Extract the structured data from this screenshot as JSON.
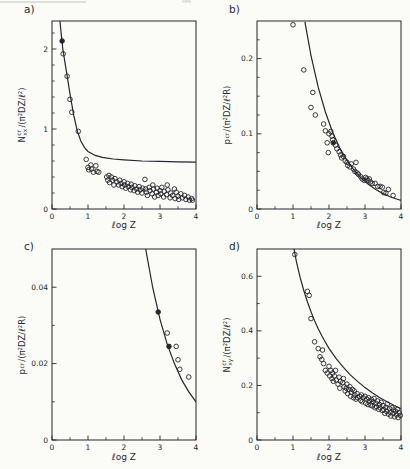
{
  "figure": {
    "background": "#fbfbf8",
    "ink": "#26262b",
    "marker": "open-circle"
  },
  "chart_data": [
    {
      "type": "scatter",
      "panel_label": "a)",
      "xlabel": "ℓog Z",
      "ylabel": {
        "pre": "N",
        "sup": "cr",
        "sub": "xx",
        "post": "/(π²DZ/ℓ²)"
      },
      "xlim": [
        0,
        4
      ],
      "ylim": [
        0,
        2.35
      ],
      "x_ticks": [
        {
          "v": 0,
          "label": "0"
        },
        {
          "v": 1,
          "label": "1"
        },
        {
          "v": 2,
          "label": "2"
        },
        {
          "v": 3,
          "label": "3"
        },
        {
          "v": 4,
          "label": "4"
        }
      ],
      "x_minor_step": 0.5,
      "y_ticks": [
        {
          "v": 0,
          "label": "0"
        },
        {
          "v": 1,
          "label": "1"
        },
        {
          "v": 2,
          "label": "2"
        }
      ],
      "y_minor_step": 0.2,
      "curve": [
        [
          0.22,
          2.35
        ],
        [
          0.3,
          2.0
        ],
        [
          0.4,
          1.72
        ],
        [
          0.5,
          1.44
        ],
        [
          0.6,
          1.18
        ],
        [
          0.7,
          0.98
        ],
        [
          0.8,
          0.85
        ],
        [
          0.9,
          0.77
        ],
        [
          1.0,
          0.72
        ],
        [
          1.2,
          0.67
        ],
        [
          1.4,
          0.645
        ],
        [
          1.7,
          0.625
        ],
        [
          2.0,
          0.615
        ],
        [
          2.5,
          0.6
        ],
        [
          3.0,
          0.595
        ],
        [
          3.5,
          0.59
        ],
        [
          4.0,
          0.585
        ]
      ],
      "points": [
        [
          0.28,
          2.1,
          1
        ],
        [
          0.31,
          1.94
        ],
        [
          0.42,
          1.66
        ],
        [
          0.5,
          1.37
        ],
        [
          0.55,
          1.21
        ],
        [
          0.73,
          0.97
        ],
        [
          0.95,
          0.62
        ],
        [
          1.0,
          0.52
        ],
        [
          1.02,
          0.49
        ],
        [
          1.08,
          0.55
        ],
        [
          1.1,
          0.5
        ],
        [
          1.15,
          0.46
        ],
        [
          1.22,
          0.54
        ],
        [
          1.25,
          0.47
        ],
        [
          1.3,
          0.46
        ],
        [
          1.52,
          0.4
        ],
        [
          1.55,
          0.36
        ],
        [
          1.58,
          0.42
        ],
        [
          1.6,
          0.33
        ],
        [
          1.65,
          0.4
        ],
        [
          1.68,
          0.36
        ],
        [
          1.72,
          0.3
        ],
        [
          1.75,
          0.38
        ],
        [
          1.8,
          0.34
        ],
        [
          1.85,
          0.3
        ],
        [
          1.88,
          0.36
        ],
        [
          1.92,
          0.32
        ],
        [
          1.95,
          0.28
        ],
        [
          2.0,
          0.34
        ],
        [
          2.02,
          0.3
        ],
        [
          2.05,
          0.26
        ],
        [
          2.1,
          0.32
        ],
        [
          2.12,
          0.28
        ],
        [
          2.18,
          0.24
        ],
        [
          2.2,
          0.31
        ],
        [
          2.22,
          0.27
        ],
        [
          2.28,
          0.23
        ],
        [
          2.3,
          0.29
        ],
        [
          2.35,
          0.25
        ],
        [
          2.38,
          0.21
        ],
        [
          2.42,
          0.28
        ],
        [
          2.45,
          0.24
        ],
        [
          2.5,
          0.2
        ],
        [
          2.52,
          0.26
        ],
        [
          2.58,
          0.37
        ],
        [
          2.6,
          0.25
        ],
        [
          2.62,
          0.21
        ],
        [
          2.65,
          0.17
        ],
        [
          2.7,
          0.27
        ],
        [
          2.72,
          0.23
        ],
        [
          2.78,
          0.19
        ],
        [
          2.8,
          0.3
        ],
        [
          2.82,
          0.25
        ],
        [
          2.85,
          0.15
        ],
        [
          2.9,
          0.21
        ],
        [
          2.92,
          0.26
        ],
        [
          2.95,
          0.17
        ],
        [
          3.0,
          0.23
        ],
        [
          3.02,
          0.19
        ],
        [
          3.05,
          0.27
        ],
        [
          3.1,
          0.15
        ],
        [
          3.12,
          0.22
        ],
        [
          3.18,
          0.18
        ],
        [
          3.2,
          0.3
        ],
        [
          3.22,
          0.24
        ],
        [
          3.28,
          0.14
        ],
        [
          3.3,
          0.2
        ],
        [
          3.35,
          0.17
        ],
        [
          3.4,
          0.25
        ],
        [
          3.42,
          0.13
        ],
        [
          3.45,
          0.21
        ],
        [
          3.5,
          0.16
        ],
        [
          3.52,
          0.12
        ],
        [
          3.58,
          0.19
        ],
        [
          3.62,
          0.14
        ],
        [
          3.68,
          0.17
        ],
        [
          3.72,
          0.12
        ],
        [
          3.78,
          0.15
        ],
        [
          3.82,
          0.11
        ],
        [
          3.88,
          0.13
        ],
        [
          3.9,
          0.11
        ]
      ]
    },
    {
      "type": "scatter",
      "panel_label": "b)",
      "xlabel": "ℓog Z",
      "ylabel": {
        "pre": "p",
        "sup": "",
        "sub": "cr",
        "post": "/(π²DZ/ℓ²R)"
      },
      "xlim": [
        0,
        4
      ],
      "ylim": [
        0,
        0.25
      ],
      "x_ticks": [
        {
          "v": 0,
          "label": "0"
        },
        {
          "v": 1,
          "label": "1"
        },
        {
          "v": 2,
          "label": "2"
        },
        {
          "v": 3,
          "label": "3"
        },
        {
          "v": 4,
          "label": "4"
        }
      ],
      "x_minor_step": 0.5,
      "y_ticks": [
        {
          "v": 0,
          "label": "0"
        },
        {
          "v": 0.1,
          "label": "0.1"
        },
        {
          "v": 0.2,
          "label": "0.2"
        }
      ],
      "y_minor_step": 0.025,
      "curve": [
        [
          1.33,
          0.249
        ],
        [
          1.5,
          0.204
        ],
        [
          1.7,
          0.162
        ],
        [
          1.9,
          0.129
        ],
        [
          2.1,
          0.102
        ],
        [
          2.3,
          0.081
        ],
        [
          2.5,
          0.0647
        ],
        [
          2.7,
          0.0514
        ],
        [
          2.9,
          0.0408
        ],
        [
          3.1,
          0.0324
        ],
        [
          3.3,
          0.0258
        ],
        [
          3.5,
          0.0205
        ],
        [
          3.7,
          0.0163
        ],
        [
          3.9,
          0.0129
        ],
        [
          4.0,
          0.0115
        ]
      ],
      "points": [
        [
          1.0,
          0.245
        ],
        [
          1.3,
          0.185
        ],
        [
          1.5,
          0.135
        ],
        [
          1.55,
          0.155
        ],
        [
          1.62,
          0.125
        ],
        [
          1.85,
          0.113
        ],
        [
          1.9,
          0.104
        ],
        [
          1.95,
          0.088
        ],
        [
          1.98,
          0.075
        ],
        [
          2.0,
          0.1
        ],
        [
          2.05,
          0.103
        ],
        [
          2.08,
          0.097
        ],
        [
          2.1,
          0.092
        ],
        [
          2.12,
          0.088,
          1
        ],
        [
          2.18,
          0.085
        ],
        [
          2.22,
          0.08
        ],
        [
          2.28,
          0.076
        ],
        [
          2.32,
          0.072
        ],
        [
          2.35,
          0.068
        ],
        [
          2.4,
          0.07
        ],
        [
          2.45,
          0.064
        ],
        [
          2.5,
          0.062
        ],
        [
          2.52,
          0.058
        ],
        [
          2.58,
          0.056
        ],
        [
          2.62,
          0.06
        ],
        [
          2.68,
          0.053
        ],
        [
          2.72,
          0.05
        ],
        [
          2.75,
          0.062
        ],
        [
          2.78,
          0.048
        ],
        [
          2.82,
          0.046
        ],
        [
          2.88,
          0.043
        ],
        [
          2.92,
          0.04
        ],
        [
          2.98,
          0.038
        ],
        [
          3.02,
          0.042
        ],
        [
          3.05,
          0.04
        ],
        [
          3.08,
          0.038
        ],
        [
          3.12,
          0.04
        ],
        [
          3.15,
          0.036
        ],
        [
          3.2,
          0.034
        ],
        [
          3.28,
          0.034
        ],
        [
          3.35,
          0.03
        ],
        [
          3.42,
          0.03
        ],
        [
          3.48,
          0.029
        ],
        [
          3.52,
          0.022
        ],
        [
          3.58,
          0.021
        ],
        [
          3.65,
          0.026
        ],
        [
          3.78,
          0.018
        ]
      ]
    },
    {
      "type": "scatter",
      "panel_label": "c)",
      "xlabel": "ℓog Z",
      "ylabel": {
        "pre": "p",
        "sup": "",
        "sub": "cr",
        "post": "/(π²DZ/ℓ²R)"
      },
      "xlim": [
        0,
        4
      ],
      "ylim": [
        0,
        0.05
      ],
      "x_ticks": [
        {
          "v": 0,
          "label": "0"
        },
        {
          "v": 1,
          "label": "1"
        },
        {
          "v": 2,
          "label": "2"
        },
        {
          "v": 3,
          "label": "3"
        },
        {
          "v": 4,
          "label": "4"
        }
      ],
      "x_minor_step": 0.5,
      "y_ticks": [
        {
          "v": 0,
          "label": "0"
        },
        {
          "v": 0.02,
          "label": "0.02"
        },
        {
          "v": 0.04,
          "label": "0.04"
        }
      ],
      "y_minor_step": 0.01,
      "curve": [
        [
          2.6,
          0.0501
        ],
        [
          2.8,
          0.0398
        ],
        [
          3.0,
          0.0316
        ],
        [
          3.2,
          0.0251
        ],
        [
          3.4,
          0.02
        ],
        [
          3.6,
          0.0158
        ],
        [
          3.8,
          0.0126
        ],
        [
          4.0,
          0.01
        ]
      ],
      "points": [
        [
          2.95,
          0.0335,
          1
        ],
        [
          3.2,
          0.028
        ],
        [
          3.25,
          0.0245,
          1
        ],
        [
          3.45,
          0.0245
        ],
        [
          3.5,
          0.021
        ],
        [
          3.55,
          0.0185
        ],
        [
          3.8,
          0.0165
        ]
      ]
    },
    {
      "type": "scatter",
      "panel_label": "d)",
      "xlabel": "ℓog Z",
      "ylabel": {
        "pre": "N",
        "sup": "cr",
        "sub": "xy",
        "post": "/(π²DZ/ℓ²)"
      },
      "xlim": [
        0,
        4
      ],
      "ylim": [
        0,
        0.7
      ],
      "x_ticks": [
        {
          "v": 0,
          "label": "0"
        },
        {
          "v": 1,
          "label": "1"
        },
        {
          "v": 2,
          "label": "2"
        },
        {
          "v": 3,
          "label": "3"
        },
        {
          "v": 4,
          "label": "4"
        }
      ],
      "x_minor_step": 0.5,
      "y_ticks": [
        {
          "v": 0,
          "label": "0"
        },
        {
          "v": 0.2,
          "label": "0.2"
        },
        {
          "v": 0.4,
          "label": "0.4"
        },
        {
          "v": 0.6,
          "label": "0.6"
        }
      ],
      "y_minor_step": 0.1,
      "curve": [
        [
          1.0,
          0.72
        ],
        [
          1.1,
          0.65
        ],
        [
          1.2,
          0.595
        ],
        [
          1.3,
          0.548
        ],
        [
          1.4,
          0.507
        ],
        [
          1.5,
          0.47
        ],
        [
          1.6,
          0.437
        ],
        [
          1.7,
          0.408
        ],
        [
          1.8,
          0.382
        ],
        [
          1.9,
          0.358
        ],
        [
          2.0,
          0.336
        ],
        [
          2.2,
          0.298
        ],
        [
          2.4,
          0.266
        ],
        [
          2.6,
          0.238
        ],
        [
          2.8,
          0.214
        ],
        [
          3.0,
          0.192
        ],
        [
          3.2,
          0.173
        ],
        [
          3.4,
          0.156
        ],
        [
          3.6,
          0.141
        ],
        [
          3.8,
          0.127
        ],
        [
          4.0,
          0.115
        ]
      ],
      "points": [
        [
          1.05,
          0.68
        ],
        [
          1.4,
          0.545
        ],
        [
          1.45,
          0.53
        ],
        [
          1.5,
          0.445
        ],
        [
          1.6,
          0.36
        ],
        [
          1.7,
          0.335
        ],
        [
          1.75,
          0.305
        ],
        [
          1.8,
          0.295
        ],
        [
          1.82,
          0.33
        ],
        [
          1.85,
          0.28
        ],
        [
          1.9,
          0.255
        ],
        [
          1.95,
          0.245
        ],
        [
          2.0,
          0.27
        ],
        [
          2.02,
          0.235
        ],
        [
          2.05,
          0.255
        ],
        [
          2.08,
          0.225
        ],
        [
          2.1,
          0.245
        ],
        [
          2.12,
          0.215
        ],
        [
          2.15,
          0.235
        ],
        [
          2.18,
          0.255
        ],
        [
          2.2,
          0.22
        ],
        [
          2.25,
          0.205
        ],
        [
          2.28,
          0.23
        ],
        [
          2.3,
          0.19
        ],
        [
          2.32,
          0.215
        ],
        [
          2.38,
          0.21
        ],
        [
          2.4,
          0.225
        ],
        [
          2.42,
          0.195
        ],
        [
          2.45,
          0.18
        ],
        [
          2.48,
          0.19
        ],
        [
          2.5,
          0.205
        ],
        [
          2.52,
          0.17
        ],
        [
          2.55,
          0.185
        ],
        [
          2.58,
          0.195
        ],
        [
          2.6,
          0.16
        ],
        [
          2.62,
          0.175
        ],
        [
          2.65,
          0.185
        ],
        [
          2.68,
          0.155
        ],
        [
          2.7,
          0.18
        ],
        [
          2.72,
          0.165
        ],
        [
          2.75,
          0.15
        ],
        [
          2.78,
          0.17
        ],
        [
          2.8,
          0.155
        ],
        [
          2.85,
          0.16
        ],
        [
          2.88,
          0.145
        ],
        [
          2.9,
          0.165
        ],
        [
          2.92,
          0.14
        ],
        [
          2.95,
          0.155
        ],
        [
          3.0,
          0.16
        ],
        [
          3.02,
          0.135
        ],
        [
          3.05,
          0.15
        ],
        [
          3.08,
          0.13
        ],
        [
          3.1,
          0.155
        ],
        [
          3.12,
          0.143
        ],
        [
          3.15,
          0.128
        ],
        [
          3.18,
          0.148
        ],
        [
          3.2,
          0.125
        ],
        [
          3.22,
          0.14
        ],
        [
          3.25,
          0.152
        ],
        [
          3.28,
          0.118
        ],
        [
          3.3,
          0.135
        ],
        [
          3.32,
          0.122
        ],
        [
          3.35,
          0.143
        ],
        [
          3.38,
          0.112
        ],
        [
          3.4,
          0.13
        ],
        [
          3.42,
          0.118
        ],
        [
          3.45,
          0.138
        ],
        [
          3.48,
          0.108
        ],
        [
          3.5,
          0.126
        ],
        [
          3.52,
          0.112
        ],
        [
          3.55,
          0.098
        ],
        [
          3.58,
          0.12
        ],
        [
          3.6,
          0.105
        ],
        [
          3.62,
          0.132
        ],
        [
          3.65,
          0.095
        ],
        [
          3.68,
          0.115
        ],
        [
          3.7,
          0.102
        ],
        [
          3.72,
          0.088
        ],
        [
          3.75,
          0.118
        ],
        [
          3.78,
          0.098
        ],
        [
          3.8,
          0.11
        ],
        [
          3.82,
          0.085
        ],
        [
          3.85,
          0.105
        ],
        [
          3.88,
          0.092
        ],
        [
          3.9,
          0.112
        ],
        [
          3.92,
          0.082
        ],
        [
          3.95,
          0.1
        ],
        [
          3.98,
          0.09
        ]
      ]
    }
  ]
}
